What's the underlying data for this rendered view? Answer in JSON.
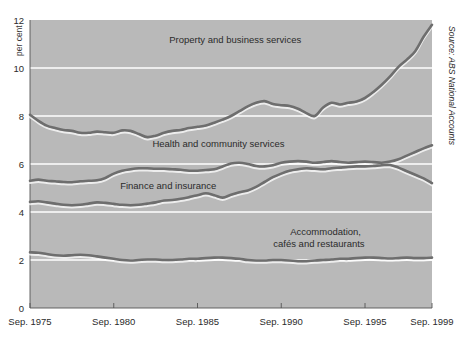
{
  "chart_data": {
    "type": "line",
    "title": "",
    "subtitle": "",
    "xlabel": "",
    "ylabel": "per cent",
    "unit_label": "per cent",
    "source": "Source: ABS National Accounts",
    "grid": true,
    "legend_position": "inline-annotations",
    "xlim": [
      1975.75,
      1999.75
    ],
    "ylim": [
      0,
      12
    ],
    "yticks": [
      0,
      2,
      4,
      6,
      8,
      10,
      12
    ],
    "ytick_labels": [
      "0",
      "2",
      "4",
      "6",
      "8",
      "10",
      "12"
    ],
    "xticks": [
      1975.75,
      1980.75,
      1985.75,
      1990.75,
      1995.75,
      1999.75
    ],
    "xtick_labels": [
      "Sep. 1975",
      "Sep. 1980",
      "Sep. 1985",
      "Sep. 1990",
      "Sep. 1995",
      "Sep. 1999"
    ],
    "x": [
      1975.75,
      1976.25,
      1976.75,
      1977.25,
      1977.75,
      1978.25,
      1978.75,
      1979.25,
      1979.75,
      1980.25,
      1980.75,
      1981.25,
      1981.75,
      1982.25,
      1982.75,
      1983.25,
      1983.75,
      1984.25,
      1984.75,
      1985.25,
      1985.75,
      1986.25,
      1986.75,
      1987.25,
      1987.75,
      1988.25,
      1988.75,
      1989.25,
      1989.75,
      1990.25,
      1990.75,
      1991.25,
      1991.75,
      1992.25,
      1992.75,
      1993.25,
      1993.75,
      1994.25,
      1994.75,
      1995.25,
      1995.75,
      1996.25,
      1996.75,
      1997.25,
      1997.75,
      1998.25,
      1998.75,
      1999.25,
      1999.75
    ],
    "series": [
      {
        "name": "Property and business services",
        "label_x": 1988.0,
        "label_y": 11.05,
        "values": [
          8.05,
          7.8,
          7.6,
          7.5,
          7.42,
          7.38,
          7.3,
          7.3,
          7.35,
          7.32,
          7.3,
          7.4,
          7.38,
          7.25,
          7.12,
          7.18,
          7.3,
          7.38,
          7.42,
          7.5,
          7.55,
          7.6,
          7.72,
          7.85,
          8.0,
          8.2,
          8.4,
          8.55,
          8.62,
          8.5,
          8.45,
          8.42,
          8.3,
          8.12,
          8.0,
          8.35,
          8.55,
          8.48,
          8.55,
          8.6,
          8.75,
          9.0,
          9.3,
          9.65,
          10.05,
          10.35,
          10.7,
          11.3,
          11.8
        ]
      },
      {
        "name": "Health and community services",
        "label_x": 1987.0,
        "label_y": 6.72,
        "values": [
          5.3,
          5.35,
          5.3,
          5.28,
          5.25,
          5.24,
          5.28,
          5.3,
          5.32,
          5.42,
          5.6,
          5.72,
          5.78,
          5.82,
          5.82,
          5.8,
          5.8,
          5.78,
          5.76,
          5.72,
          5.72,
          5.75,
          5.78,
          5.9,
          6.02,
          6.05,
          6.0,
          5.92,
          5.9,
          5.95,
          6.05,
          6.1,
          6.12,
          6.1,
          6.05,
          6.08,
          6.12,
          6.08,
          6.05,
          6.08,
          6.1,
          6.08,
          6.05,
          6.1,
          6.2,
          6.35,
          6.5,
          6.65,
          6.78
        ]
      },
      {
        "name": "Finance and insurance",
        "label_x": 1984.0,
        "label_y": 4.95,
        "values": [
          4.42,
          4.45,
          4.4,
          4.35,
          4.3,
          4.28,
          4.3,
          4.35,
          4.4,
          4.38,
          4.34,
          4.3,
          4.28,
          4.3,
          4.35,
          4.4,
          4.48,
          4.5,
          4.55,
          4.62,
          4.7,
          4.78,
          4.7,
          4.6,
          4.72,
          4.82,
          4.9,
          5.05,
          5.25,
          5.45,
          5.6,
          5.72,
          5.78,
          5.82,
          5.8,
          5.78,
          5.82,
          5.85,
          5.88,
          5.9,
          5.9,
          5.92,
          5.95,
          5.96,
          5.85,
          5.7,
          5.55,
          5.4,
          5.2
        ]
      },
      {
        "name": "Accommodation, cafés and restaurants",
        "label_x": 1993.0,
        "label_y": 2.85,
        "values": [
          2.32,
          2.3,
          2.25,
          2.2,
          2.18,
          2.2,
          2.22,
          2.2,
          2.15,
          2.1,
          2.05,
          2.0,
          1.98,
          2.0,
          2.02,
          2.02,
          2.0,
          2.0,
          2.02,
          2.05,
          2.05,
          2.08,
          2.1,
          2.1,
          2.08,
          2.05,
          2.0,
          1.98,
          1.98,
          2.0,
          2.0,
          1.98,
          1.95,
          1.95,
          1.98,
          2.0,
          2.02,
          2.05,
          2.05,
          2.08,
          2.1,
          2.1,
          2.08,
          2.06,
          2.08,
          2.1,
          2.08,
          2.08,
          2.1
        ]
      }
    ],
    "annotations": [
      {
        "text": "Property and business services",
        "x": 1988.0,
        "y": 11.05
      },
      {
        "text": "Health and community services",
        "x": 1987.0,
        "y": 6.72
      },
      {
        "text": "Finance and insurance",
        "x": 1984.0,
        "y": 4.95
      },
      {
        "text": "Accommodation,",
        "x": 1993.4,
        "y": 3.05
      },
      {
        "text": "cafés and restaurants",
        "x": 1993.0,
        "y": 2.55
      }
    ],
    "colors": {
      "plot_background": "#b9b9b9",
      "gridline": "#ffffff",
      "line": "#6e6e6e",
      "text": "#2b2b2b",
      "page_background": "#ffffff"
    }
  }
}
